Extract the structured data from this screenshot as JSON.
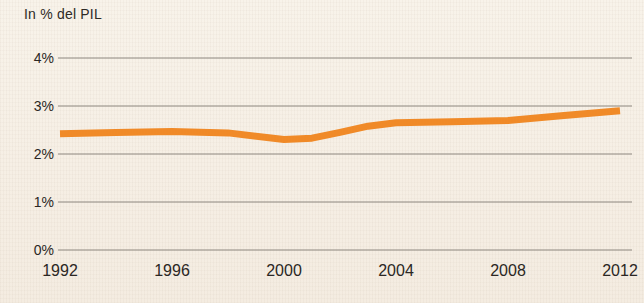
{
  "chart_data": {
    "type": "line",
    "title": "In % del PIL",
    "xlabel": "",
    "ylabel": "In % del PIL",
    "ylim": [
      0,
      4
    ],
    "xlim": [
      1992,
      2012
    ],
    "grid": true,
    "legend": null,
    "line_color": "#f08a28",
    "gridline_color": "#8e8880",
    "background_color": "#f7f1e7",
    "y_ticks": [
      "0%",
      "1%",
      "2%",
      "3%",
      "4%"
    ],
    "y_tick_values": [
      0,
      1,
      2,
      3,
      4
    ],
    "x_ticks": [
      "1992",
      "1996",
      "2000",
      "2004",
      "2008",
      "2012"
    ],
    "x_tick_values": [
      1992,
      1996,
      2000,
      2004,
      2008,
      2012
    ],
    "x": [
      1992,
      1994,
      1996,
      1998,
      2000,
      2001,
      2002,
      2003,
      2004,
      2006,
      2008,
      2010,
      2012
    ],
    "values": [
      2.42,
      2.45,
      2.47,
      2.44,
      2.3,
      2.33,
      2.45,
      2.58,
      2.65,
      2.67,
      2.7,
      2.8,
      2.9
    ],
    "series": [
      {
        "name": "In % del PIL",
        "values": [
          2.42,
          2.45,
          2.47,
          2.44,
          2.3,
          2.33,
          2.45,
          2.58,
          2.65,
          2.67,
          2.7,
          2.8,
          2.9
        ]
      }
    ]
  }
}
